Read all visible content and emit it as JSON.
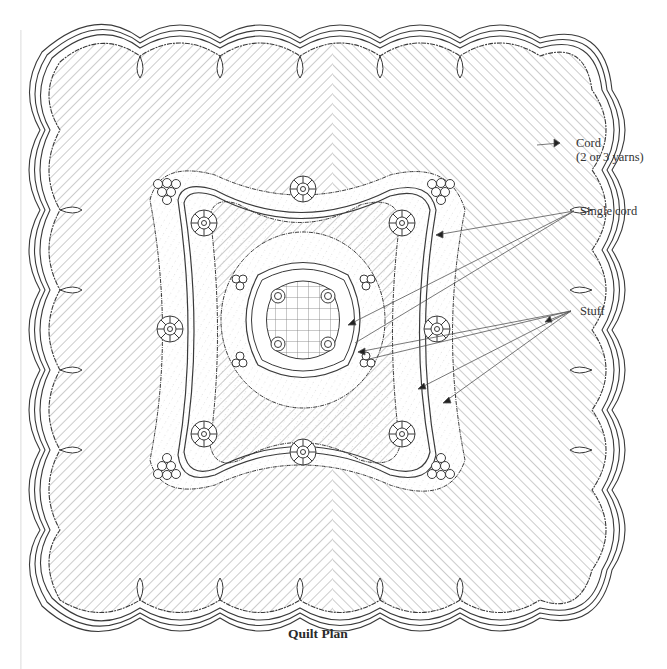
{
  "diagram": {
    "title": "Quilt Plan",
    "labels": {
      "cord_line1": "Cord",
      "cord_line2": "(2 or 3 yarns)",
      "single_cord": "Single cord",
      "stuff": "Stuff"
    },
    "colors": {
      "line": "#3a3a3a",
      "hatch": "#9a9a9a",
      "background": "#ffffff"
    },
    "elements": [
      "scalloped triple-cord outer border",
      "diagonal hatched background field",
      "wavy single-cord frame with feathered edges",
      "corner grape clusters",
      "eight rosettes",
      "central quatrefoil medallion with grid",
      "feathered wreath around center"
    ]
  }
}
